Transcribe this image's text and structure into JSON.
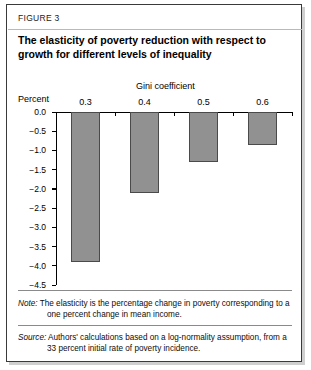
{
  "figure": {
    "label": "FIGURE 3",
    "title": "The elasticity of poverty reduction with respect to growth for different levels of inequality"
  },
  "notes": {
    "note_tag": "Note:",
    "note_text": "The elasticity is the percentage change in poverty corresponding to a one percent change in mean income.",
    "source_tag": "Source:",
    "source_text": "Authors' calculations based on a log-normality assumption, from a 33 percent initial rate of poverty incidence."
  },
  "colors": {
    "bar_fill": "#919191",
    "bar_stroke": "#4a4a4a",
    "frame": "#3a3a3a",
    "axis": "#000000"
  },
  "chart_data": {
    "type": "bar",
    "title": "The elasticity of poverty reduction with respect to growth for different levels of inequality",
    "xlabel": "Gini coefficient",
    "ylabel": "Percent",
    "categories": [
      "0.3",
      "0.4",
      "0.5",
      "0.6"
    ],
    "values": [
      -3.9,
      -2.1,
      -1.3,
      -0.85
    ],
    "ylim": [
      -4.5,
      0.0
    ],
    "ytick_labels": [
      "0.0",
      "−0.5",
      "−1.0",
      "−1.5",
      "−2.0",
      "−2.5",
      "−3.0",
      "−3.5",
      "−4.0",
      "−4.5"
    ],
    "ytick_values": [
      0.0,
      -0.5,
      -1.0,
      -1.5,
      -2.0,
      -2.5,
      -3.0,
      -3.5,
      -4.0,
      -4.5
    ],
    "grid": false,
    "legend": "none",
    "orientation": "vertical-downward"
  }
}
